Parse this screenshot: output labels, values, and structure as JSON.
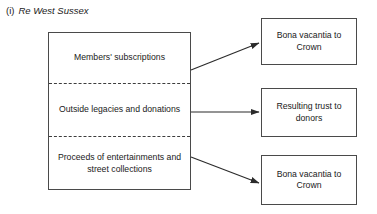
{
  "figure": {
    "caption": {
      "marker": "(i)",
      "title": "Re West Sussex"
    },
    "source_box": {
      "name": "fund-sources-box",
      "sections": [
        {
          "id": "members-subscriptions",
          "label": "Members' subscriptions"
        },
        {
          "id": "outside-legacies-donations",
          "label": "Outside legacies and donations"
        },
        {
          "id": "proceeds-entertainments-street-collections",
          "label": "Proceeds of entertainments and street collections"
        }
      ]
    },
    "outcome_boxes": [
      {
        "id": "bona-vacantia-crown-top",
        "label": "Bona vacantia to Crown"
      },
      {
        "id": "resulting-trust-donors",
        "label": "Resulting trust to donors"
      },
      {
        "id": "bona-vacantia-crown-bottom",
        "label": "Bona vacantia to Crown"
      }
    ],
    "connectors": [
      {
        "id": "arrow-members-to-bona-vacantia",
        "from": "members-subscriptions",
        "to": "bona-vacantia-crown-top",
        "direction": "up-right"
      },
      {
        "id": "arrow-legacies-to-resulting-trust",
        "from": "outside-legacies-donations",
        "to": "resulting-trust-donors",
        "direction": "horizontal"
      },
      {
        "id": "arrow-proceeds-to-bona-vacantia",
        "from": "proceeds-entertainments-street-collections",
        "to": "bona-vacantia-crown-bottom",
        "direction": "down-right"
      }
    ],
    "colors": {
      "background": "#ffffff",
      "border": "#4a4a4a",
      "divider": "#3d3d3d",
      "text": "#1a1a1a",
      "arrow": "#2b2b2b"
    }
  }
}
